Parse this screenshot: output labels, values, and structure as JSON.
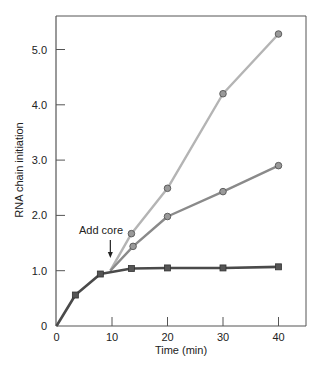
{
  "chart_data": {
    "type": "line",
    "title": "",
    "xlabel": "Time (min)",
    "ylabel": "RNA chain initiation",
    "xlim": [
      0,
      45
    ],
    "ylim": [
      0,
      5.5
    ],
    "x_ticks": [
      0,
      10,
      20,
      30,
      40
    ],
    "x_tick_labels": [
      "0",
      "10",
      "20",
      "30",
      "40"
    ],
    "y_ticks": [
      0,
      1,
      2,
      3,
      4,
      5
    ],
    "y_tick_labels": [
      "0",
      "1.0",
      "2.0",
      "3.0",
      "4.0",
      "5.0"
    ],
    "grid": false,
    "legend": null,
    "annotations": [
      {
        "text": "Add core",
        "x": 9.7,
        "arrow_to_y": 1.0,
        "style": "down-arrow"
      }
    ],
    "series": [
      {
        "name": "no core added",
        "marker": "square",
        "color": "#4a4a4a",
        "x": [
          0,
          3.4,
          7.9,
          13.5,
          20,
          30,
          40
        ],
        "y": [
          0,
          0.56,
          0.94,
          1.04,
          1.05,
          1.05,
          1.07
        ]
      },
      {
        "name": "core added (mid)",
        "marker": "circle",
        "color": "#8a8a8a",
        "x": [
          9.7,
          13.8,
          20,
          30,
          40
        ],
        "y": [
          1.0,
          1.44,
          1.98,
          2.43,
          2.9
        ],
        "line_starts_at": [
          9.7,
          1.0
        ]
      },
      {
        "name": "core added (high)",
        "marker": "circle",
        "color": "#b4b4b4",
        "x": [
          9.7,
          13.5,
          20,
          30,
          40
        ],
        "y": [
          1.0,
          1.67,
          2.49,
          4.2,
          5.28
        ],
        "line_starts_at": [
          9.7,
          1.0
        ]
      }
    ]
  }
}
